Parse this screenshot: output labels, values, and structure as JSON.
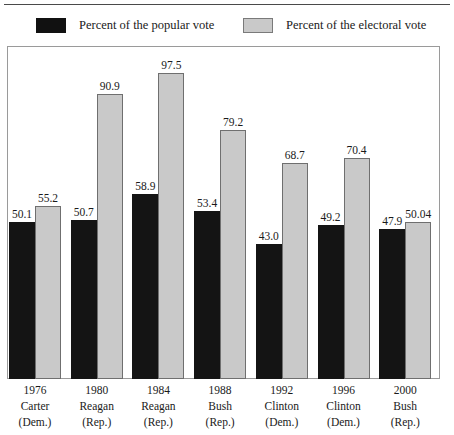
{
  "legend": {
    "items": [
      {
        "label": "Percent of the popular vote",
        "swatch": "dark-swatch",
        "color": "#141414"
      },
      {
        "label": "Percent of the electoral vote",
        "swatch": "light-swatch",
        "color": "#c9c9c9"
      }
    ]
  },
  "chart_data": {
    "type": "bar",
    "title": "",
    "xlabel": "",
    "ylabel": "",
    "ylim": [
      0,
      100
    ],
    "grid": false,
    "legend_position": "top",
    "categories": [
      "1976 Carter (Dem.)",
      "1980 Reagan (Rep.)",
      "1984 Reagan (Rep.)",
      "1988 Bush (Rep.)",
      "1992 Clinton (Dem.)",
      "1996 Clinton (Dem.)",
      "2000 Bush (Rep.)"
    ],
    "category_lines": [
      {
        "year": "1976",
        "name": "Carter",
        "party": "(Dem.)"
      },
      {
        "year": "1980",
        "name": "Reagan",
        "party": "(Rep.)"
      },
      {
        "year": "1984",
        "name": "Reagan",
        "party": "(Rep.)"
      },
      {
        "year": "1988",
        "name": "Bush",
        "party": "(Rep.)"
      },
      {
        "year": "1992",
        "name": "Clinton",
        "party": "(Dem.)"
      },
      {
        "year": "1996",
        "name": "Clinton",
        "party": "(Dem.)"
      },
      {
        "year": "2000",
        "name": "Bush",
        "party": "(Rep.)"
      }
    ],
    "series": [
      {
        "name": "Percent of the popular vote",
        "color": "#141414",
        "values": [
          50.1,
          50.7,
          58.9,
          53.4,
          43.0,
          49.2,
          47.9
        ],
        "labels": [
          "50.1",
          "50.7",
          "58.9",
          "53.4",
          "43.0",
          "49.2",
          "47.9"
        ]
      },
      {
        "name": "Percent of the electoral vote",
        "color": "#c9c9c9",
        "values": [
          55.2,
          90.9,
          97.5,
          79.2,
          68.7,
          70.4,
          50.04
        ],
        "labels": [
          "55.2",
          "90.9",
          "97.5",
          "79.2",
          "68.7",
          "70.4",
          "50.04"
        ]
      }
    ]
  }
}
